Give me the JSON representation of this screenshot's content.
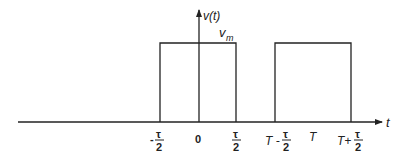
{
  "diagram": {
    "y_axis_label": "v(t)",
    "x_axis_label": "t",
    "amplitude_label": "v",
    "amplitude_subscript": "m",
    "ticks": [
      {
        "id": "neg-tau-half",
        "prefix": "-",
        "numerator": "τ",
        "denominator": "2"
      },
      {
        "id": "zero",
        "text": "0"
      },
      {
        "id": "tau-half",
        "prefix": "",
        "numerator": "τ",
        "denominator": "2"
      },
      {
        "id": "T-minus-tau-half",
        "prefix": "T -",
        "numerator": "τ",
        "denominator": "2"
      },
      {
        "id": "T",
        "text": "T"
      },
      {
        "id": "T-plus-tau-half",
        "prefix": "T+",
        "numerator": "τ",
        "denominator": "2"
      }
    ],
    "pulses": [
      {
        "start": "-τ/2",
        "end": "τ/2",
        "height": "v_m"
      },
      {
        "start": "T-τ/2",
        "end": "T+τ/2",
        "height": "v_m"
      }
    ],
    "colors": {
      "stroke": "#222222",
      "background": "#ffffff"
    }
  }
}
